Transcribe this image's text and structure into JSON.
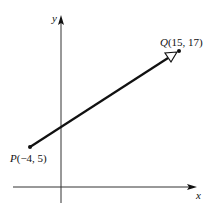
{
  "diagram": {
    "type": "vector-on-coordinate-plane",
    "axes": {
      "x_label": "x",
      "y_label": "y"
    },
    "points": {
      "P": {
        "name": "P",
        "coords_text": "(−4, 5)",
        "x": -4,
        "y": 5
      },
      "Q": {
        "name": "Q",
        "coords_text": "(15, 17)",
        "x": 15,
        "y": 17
      }
    },
    "vector": {
      "from": "P",
      "to": "Q",
      "arrowhead": "hollow"
    },
    "colors": {
      "stroke": "#111111",
      "background": "#ffffff"
    }
  }
}
